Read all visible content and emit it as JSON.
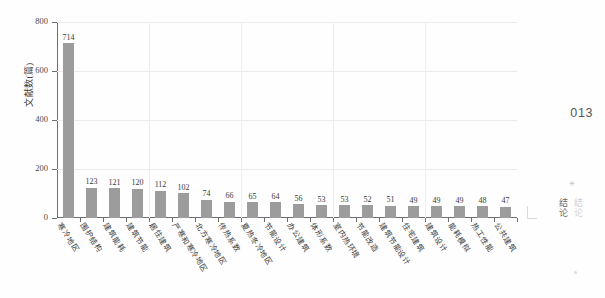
{
  "page": {
    "number": "013",
    "margin_tab_label": "结论",
    "margin_tab_ghost_label": "结论",
    "marker_glyph": "✳"
  },
  "chart_data": {
    "type": "bar",
    "title": "",
    "xlabel": "",
    "ylabel": "文献数(篇)",
    "ylim": [
      0,
      800
    ],
    "yticks": [
      0,
      200,
      400,
      600,
      800
    ],
    "ytick_labels": [
      "0",
      "200",
      "400",
      "600",
      "800"
    ],
    "grid": true,
    "legend": "none",
    "bar_color": "#9c9c9c",
    "categories": [
      "寒冷地区",
      "围护结构",
      "建筑能耗",
      "建筑节能",
      "居住建筑",
      "严寒和寒冷地区",
      "北方寒冷地区",
      "传热系数",
      "夏热冬冷地区",
      "节能设计",
      "办公建筑",
      "体形系数",
      "室内热环境",
      "节能改造",
      "建筑节能设计",
      "住宅建筑",
      "建筑设计",
      "能耗模拟",
      "热工性能",
      "公共建筑"
    ],
    "values": [
      714,
      123,
      121,
      120,
      112,
      102,
      74,
      66,
      65,
      64,
      56,
      53,
      53,
      52,
      51,
      49,
      49,
      49,
      48,
      47
    ],
    "value_labels": [
      "714",
      "123",
      "121",
      "120",
      "112",
      "102",
      "74",
      "66",
      "65",
      "64",
      "56",
      "53",
      "53",
      "52",
      "51",
      "49",
      "49",
      "49",
      "48",
      "47"
    ]
  }
}
